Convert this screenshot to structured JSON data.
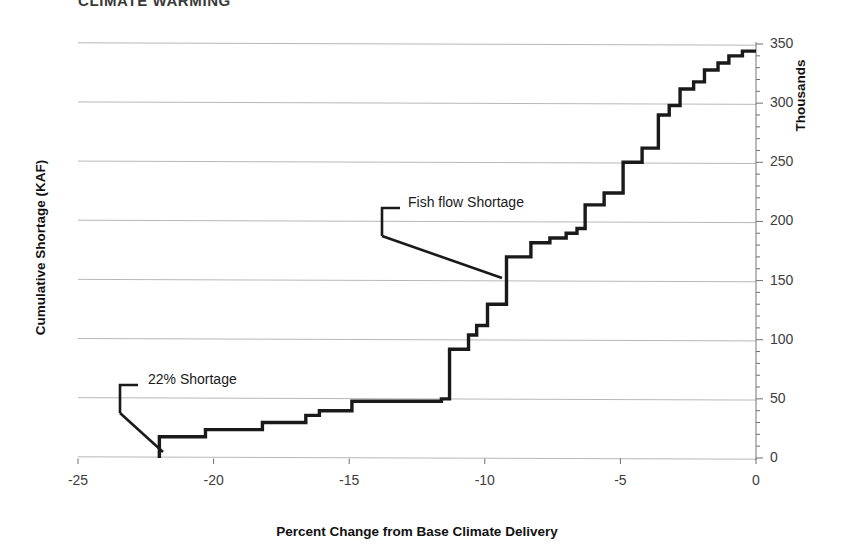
{
  "figure": {
    "cut_off_title": "CLIMATE WARMING",
    "background": "#ffffff",
    "line_color": "#1a1a1a",
    "grid_color": "#b8b8b8"
  },
  "chart_data": {
    "type": "line",
    "subtype": "step",
    "title": "",
    "xlabel": "Percent Change from Base Climate Delivery",
    "ylabel": "Cumulative Shortage (KAF)",
    "y2label": "Thousands",
    "xlim": [
      -25,
      0
    ],
    "ylim": [
      0,
      350
    ],
    "grid": true,
    "legend": "none",
    "xticks": [
      -25,
      -20,
      -15,
      -10,
      -5,
      0
    ],
    "xtick_labels": [
      "-25",
      "-20",
      "-15",
      "-10",
      "-5",
      "0"
    ],
    "yticks": [
      0,
      50,
      100,
      150,
      200,
      250,
      300,
      350
    ],
    "ytick_labels": [
      "0",
      "50",
      "100",
      "150",
      "200",
      "250",
      "300",
      "350"
    ],
    "y_minor_tick_step": 10,
    "x_axis_position": "bottom",
    "y_axis_position": "right",
    "x": [
      -22.0,
      -22.0,
      -20.3,
      -20.3,
      -18.2,
      -18.2,
      -16.6,
      -16.6,
      -16.1,
      -16.1,
      -14.9,
      -14.9,
      -11.6,
      -11.6,
      -11.3,
      -11.3,
      -10.6,
      -10.6,
      -10.3,
      -10.3,
      -9.9,
      -9.9,
      -9.2,
      -9.2,
      -8.3,
      -8.3,
      -7.6,
      -7.6,
      -7.0,
      -7.0,
      -6.6,
      -6.6,
      -6.3,
      -6.3,
      -5.6,
      -5.6,
      -4.9,
      -4.9,
      -4.2,
      -4.2,
      -3.6,
      -3.6,
      -3.2,
      -3.2,
      -2.8,
      -2.8,
      -2.3,
      -2.3,
      -1.9,
      -1.9,
      -1.4,
      -1.4,
      -1.0,
      -1.0,
      -0.5,
      -0.5,
      0.0
    ],
    "y": [
      0,
      18,
      18,
      24,
      24,
      30,
      30,
      36,
      36,
      40,
      40,
      48,
      48,
      50,
      50,
      92,
      92,
      104,
      104,
      112,
      112,
      130,
      130,
      170,
      170,
      182,
      182,
      186,
      186,
      190,
      190,
      194,
      194,
      214,
      214,
      224,
      224,
      250,
      250,
      262,
      262,
      290,
      290,
      298,
      298,
      312,
      312,
      318,
      318,
      328,
      328,
      334,
      334,
      340,
      340,
      344,
      344
    ],
    "series_name": "Cumulative Shortage",
    "annotations": [
      {
        "id": "shortage-22",
        "label": "22% Shortage",
        "text_x": 148,
        "text_y": 371,
        "bracket": {
          "x": 120,
          "y_top": 385,
          "y_bottom": 413,
          "tip_x": 138
        },
        "leader": {
          "x1": 120,
          "y1": 413,
          "x2": 163,
          "y2": 452
        }
      },
      {
        "id": "fish-flow-shortage",
        "label": "Fish flow Shortage",
        "text_x": 408,
        "text_y": 194,
        "bracket": {
          "x": 382,
          "y_top": 208,
          "y_bottom": 236,
          "tip_x": 400
        },
        "leader": {
          "x1": 382,
          "y1": 236,
          "x2": 502,
          "y2": 278
        }
      }
    ]
  }
}
